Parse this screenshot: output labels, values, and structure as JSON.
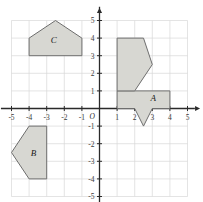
{
  "figure": {
    "origin_label": "O",
    "grid": {
      "visible": true,
      "color": "#d8d8d8",
      "step": 1
    },
    "axis_color": "#2a2a2a",
    "shape_fill": "#d7d7d2",
    "shape_stroke": "#6e6e6e"
  },
  "axes": {
    "x": {
      "min": -5.6,
      "max": 5.6,
      "label_min": -5,
      "label_max": 5,
      "ticks": [
        -5,
        -4,
        -3,
        -2,
        -1,
        1,
        2,
        3,
        4,
        5
      ],
      "tick_labels": [
        "-5",
        "-4",
        "-3",
        "-2",
        "-1",
        "1",
        "2",
        "3",
        "4",
        "5"
      ],
      "arrow": "right"
    },
    "y": {
      "min": -5.6,
      "max": 5.6,
      "label_min": -5,
      "label_max": 5,
      "ticks": [
        5,
        4,
        3,
        2,
        1,
        -1,
        -2,
        -3,
        -4,
        -5
      ],
      "tick_labels": [
        "5",
        "4",
        "3",
        "2",
        "1",
        "-1",
        "-2",
        "-3",
        "-4",
        "-5"
      ],
      "arrow": "up"
    }
  },
  "shapes": [
    {
      "name": "shape-a",
      "label": "A",
      "label_at": {
        "x": 3.05,
        "y": 0.42
      },
      "vertices": [
        [
          1,
          1
        ],
        [
          4,
          1
        ],
        [
          4,
          0
        ],
        [
          3,
          0
        ],
        [
          2.5,
          -1
        ],
        [
          2,
          0
        ],
        [
          1,
          0
        ]
      ]
    },
    {
      "name": "shape-unlabeled-top",
      "label": "",
      "label_at": null,
      "vertices": [
        [
          1,
          1
        ],
        [
          1,
          4
        ],
        [
          2.5,
          4
        ],
        [
          3,
          2.5
        ],
        [
          2,
          1
        ]
      ]
    },
    {
      "name": "shape-c",
      "label": "C",
      "label_at": {
        "x": -2.6,
        "y": 3.75
      },
      "vertices": [
        [
          -4,
          3
        ],
        [
          -4,
          4
        ],
        [
          -2.5,
          5
        ],
        [
          -1,
          4
        ],
        [
          -1,
          3
        ]
      ]
    },
    {
      "name": "shape-b",
      "label": "B",
      "label_at": {
        "x": -3.75,
        "y": -2.7
      },
      "vertices": [
        [
          -3,
          -1
        ],
        [
          -4,
          -1
        ],
        [
          -5,
          -2.5
        ],
        [
          -4,
          -4
        ],
        [
          -3,
          -4
        ]
      ]
    }
  ]
}
